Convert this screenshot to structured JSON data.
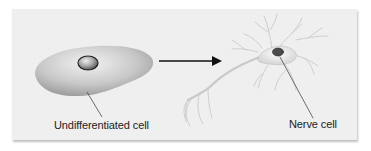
{
  "diagram": {
    "labels": {
      "undifferentiated": "Undifferentiated cell",
      "nerve": "Nerve cell"
    },
    "nodes": [
      {
        "id": "undifferentiated-cell",
        "label": "Undifferentiated cell",
        "shape": "blob-with-nucleus"
      },
      {
        "id": "nerve-cell",
        "label": "Nerve cell",
        "shape": "neuron"
      }
    ],
    "edges": [
      {
        "from": "undifferentiated-cell",
        "to": "nerve-cell",
        "type": "arrow"
      }
    ],
    "colors": {
      "panel": "#efefef",
      "cell_fill": "#bdbdbd",
      "nucleus": "#555555",
      "arrow": "#111111",
      "neuron": "#d6d6d6"
    }
  }
}
